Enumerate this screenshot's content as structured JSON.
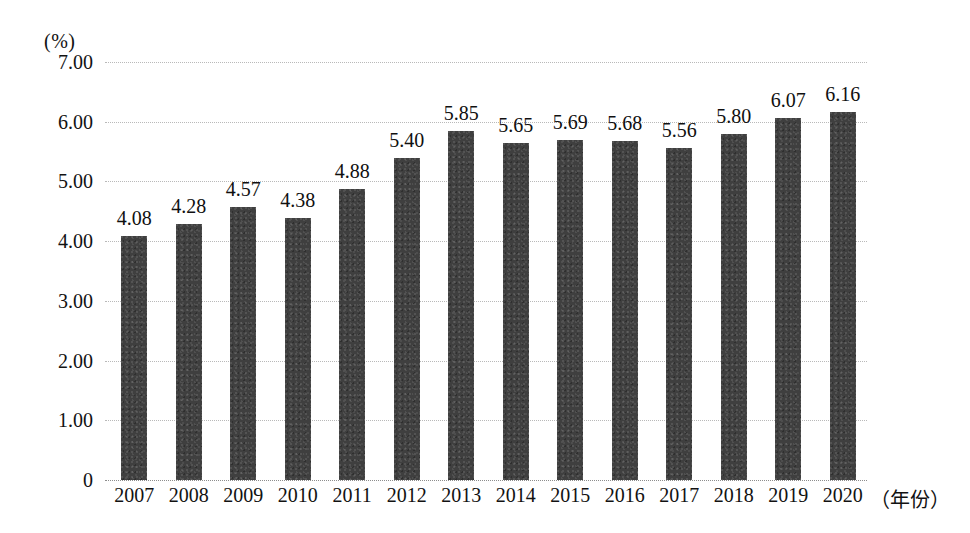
{
  "chart_data": {
    "type": "bar",
    "title": "",
    "subtitle": "",
    "xlabel": "（年份）",
    "ylabel": "(%)",
    "categories": [
      "2007",
      "2008",
      "2009",
      "2010",
      "2011",
      "2012",
      "2013",
      "2014",
      "2015",
      "2016",
      "2017",
      "2018",
      "2019",
      "2020"
    ],
    "values": [
      4.08,
      4.28,
      4.57,
      4.38,
      4.88,
      5.4,
      5.85,
      5.65,
      5.69,
      5.68,
      5.56,
      5.8,
      6.07,
      6.16
    ],
    "data_labels": [
      "4.08",
      "4.28",
      "4.57",
      "4.38",
      "4.88",
      "5.40",
      "5.85",
      "5.65",
      "5.69",
      "5.68",
      "5.56",
      "5.80",
      "6.07",
      "6.16"
    ],
    "ylim": [
      0,
      7
    ],
    "ytick_values": [
      7,
      6,
      5,
      4,
      3,
      2,
      1,
      0
    ],
    "ytick_labels": [
      "7.00",
      "6.00",
      "5.00",
      "4.00",
      "3.00",
      "2.00",
      "1.00",
      "0"
    ],
    "grid": true,
    "grid_style": "dotted-horizontal",
    "legend": null,
    "legend_position": "none",
    "series": [
      {
        "name": "",
        "values": [
          4.08,
          4.28,
          4.57,
          4.38,
          4.88,
          5.4,
          5.85,
          5.65,
          5.69,
          5.68,
          5.56,
          5.8,
          6.07,
          6.16
        ]
      }
    ],
    "colors": {
      "bar": "#3f3f3f",
      "grid": "#b9b9b9",
      "text": "#121212",
      "background": "#ffffff"
    }
  }
}
